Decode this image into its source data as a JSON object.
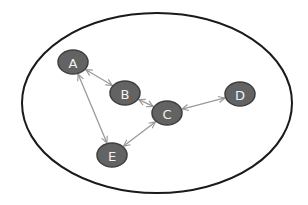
{
  "diagram": {
    "type": "graph",
    "boundary": {
      "shape": "ellipse",
      "cx": 157,
      "cy": 103,
      "rx": 135,
      "ry": 90,
      "stroke": "#1a1a1a"
    },
    "node_style": {
      "fill": "#636363",
      "stroke": "#3e3e3e",
      "label_color": "#f2f2f2",
      "rx": 15,
      "ry": 12
    },
    "edge_style": {
      "stroke": "#9a9a9a",
      "directed": "bidirectional"
    },
    "nodes": [
      {
        "id": "A",
        "label": "A",
        "x": 73,
        "y": 62
      },
      {
        "id": "B",
        "label": "B",
        "x": 125,
        "y": 93
      },
      {
        "id": "C",
        "label": "C",
        "x": 167,
        "y": 113
      },
      {
        "id": "D",
        "label": "D",
        "x": 240,
        "y": 94
      },
      {
        "id": "E",
        "label": "E",
        "x": 112,
        "y": 155
      }
    ],
    "edges": [
      {
        "from": "A",
        "to": "B",
        "bidirectional": true
      },
      {
        "from": "B",
        "to": "C",
        "bidirectional": true
      },
      {
        "from": "C",
        "to": "D",
        "bidirectional": true
      },
      {
        "from": "C",
        "to": "E",
        "bidirectional": true
      },
      {
        "from": "A",
        "to": "E",
        "bidirectional": true
      }
    ]
  }
}
